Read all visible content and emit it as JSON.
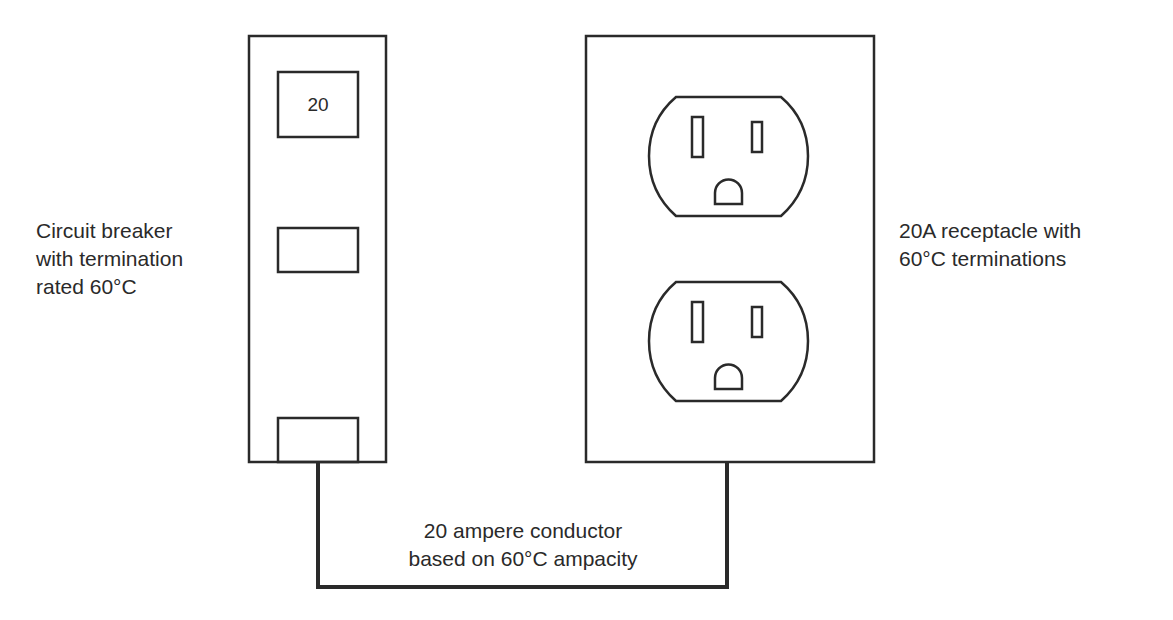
{
  "diagram": {
    "breaker": {
      "rating": "20",
      "label_lines": [
        "Circuit breaker",
        "with termination",
        "rated 60°C"
      ]
    },
    "receptacle": {
      "outlet_count": 2,
      "label_lines": [
        "20A receptacle with",
        "60°C terminations"
      ]
    },
    "conductor": {
      "label_lines": [
        "20 ampere conductor",
        "based on 60°C ampacity"
      ]
    },
    "colors": {
      "stroke": "#2a2a2a",
      "background": "#ffffff"
    }
  }
}
